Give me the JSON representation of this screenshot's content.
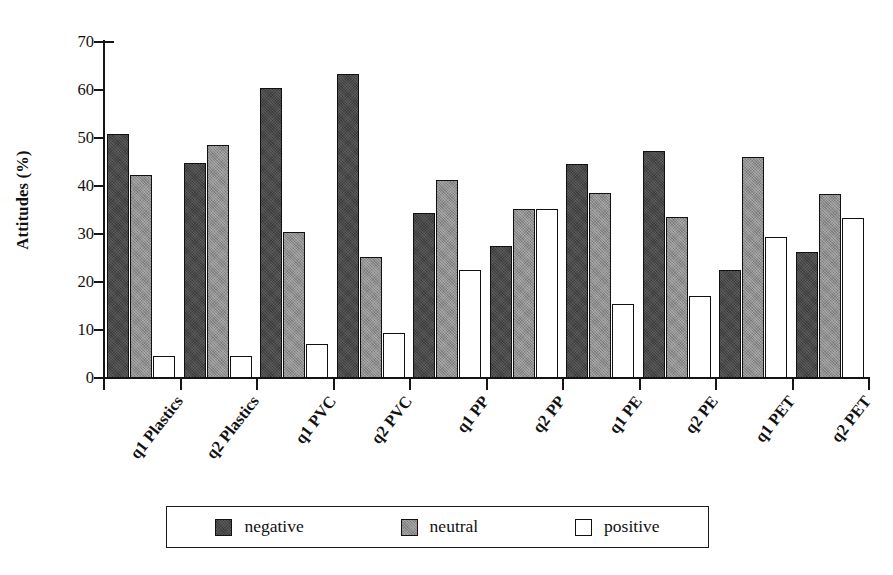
{
  "chart_data": {
    "type": "bar",
    "title": "",
    "subtitle": "",
    "xlabel": "",
    "ylabel": "Attitudes (%)",
    "ylim": [
      0,
      70
    ],
    "ytick_values": [
      0,
      10,
      20,
      30,
      40,
      50,
      60,
      70
    ],
    "ytick_labels": [
      "0",
      "10",
      "20",
      "30",
      "40",
      "50",
      "60",
      "70"
    ],
    "grid": false,
    "legend_position": "bottom-center",
    "categories": [
      "q1 Plastics",
      "q2 Plastics",
      "q1 PVC",
      "q2 PVC",
      "q1 PP",
      "q2 PP",
      "q1 PE",
      "q2 PE",
      "q1 PET",
      "q2 PET"
    ],
    "series": [
      {
        "name": "negative",
        "color": "#3b3b3b",
        "values": [
          50.8,
          44.7,
          60.5,
          63.3,
          34.3,
          27.6,
          44.5,
          47.3,
          22.5,
          26.3
        ]
      },
      {
        "name": "neutral",
        "color": "#8f8f8f",
        "values": [
          42.3,
          48.5,
          30.5,
          25.3,
          41.2,
          35.2,
          38.5,
          33.6,
          46.0,
          38.3
        ]
      },
      {
        "name": "positive",
        "color": "#ffffff",
        "values": [
          4.5,
          4.5,
          7.0,
          9.3,
          22.5,
          35.3,
          15.5,
          17.0,
          29.3,
          33.3
        ]
      }
    ],
    "legend_entries": [
      "negative",
      "neutral",
      "positive"
    ]
  },
  "legend": {
    "items": [
      {
        "label": "negative",
        "swatch": "negative"
      },
      {
        "label": "neutral",
        "swatch": "neutral"
      },
      {
        "label": "positive",
        "swatch": "positive"
      }
    ]
  }
}
